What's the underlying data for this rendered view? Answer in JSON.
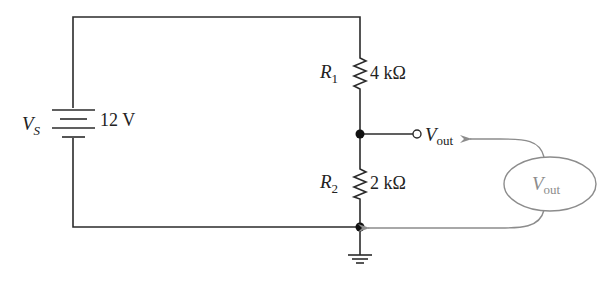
{
  "source": {
    "symbol": "V",
    "subscript": "S",
    "value": "12 V"
  },
  "resistors": [
    {
      "symbol": "R",
      "subscript": "1",
      "value": "4 kΩ"
    },
    {
      "symbol": "R",
      "subscript": "2",
      "value": "2 kΩ"
    }
  ],
  "output_terminal": {
    "symbol": "V",
    "subscript": "out"
  },
  "meter": {
    "symbol": "V",
    "subscript": "out"
  },
  "colors": {
    "wire": "#2b2b2b",
    "probe": "#8c8c8c",
    "background": "#ffffff"
  }
}
